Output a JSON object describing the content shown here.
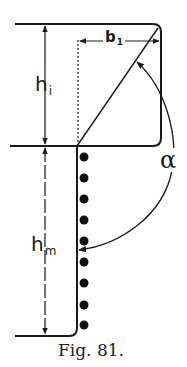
{
  "figure": {
    "caption": "Fig. 81.",
    "labels": {
      "h_i": {
        "base": "h",
        "sub": "i"
      },
      "h_m": {
        "base": "h",
        "sub": "m"
      },
      "b_1": {
        "base": "b",
        "sub": "1"
      },
      "alpha": "α"
    },
    "colors": {
      "ink": "#1a1a1a",
      "background": "#ffffff"
    },
    "dots": {
      "count": 9,
      "x": 84,
      "y_positions": [
        157,
        178,
        199,
        220,
        241,
        262,
        283,
        305,
        325
      ]
    }
  }
}
